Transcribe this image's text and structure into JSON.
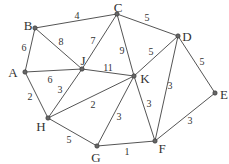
{
  "graph": {
    "nodes": [
      {
        "id": "A",
        "x": 25,
        "y": 72,
        "lx": 13,
        "ly": 72
      },
      {
        "id": "B",
        "x": 35,
        "y": 28,
        "lx": 28,
        "ly": 25
      },
      {
        "id": "C",
        "x": 117,
        "y": 14,
        "lx": 118,
        "ly": 7
      },
      {
        "id": "D",
        "x": 178,
        "y": 36,
        "lx": 187,
        "ly": 36
      },
      {
        "id": "E",
        "x": 215,
        "y": 93,
        "lx": 224,
        "ly": 94
      },
      {
        "id": "F",
        "x": 155,
        "y": 141,
        "lx": 162,
        "ly": 148
      },
      {
        "id": "G",
        "x": 97,
        "y": 146,
        "lx": 96,
        "ly": 157
      },
      {
        "id": "H",
        "x": 48,
        "y": 118,
        "lx": 41,
        "ly": 126
      },
      {
        "id": "J",
        "x": 82,
        "y": 69,
        "lx": 83,
        "ly": 60
      },
      {
        "id": "K",
        "x": 134,
        "y": 76,
        "lx": 145,
        "ly": 78
      }
    ],
    "edges": [
      {
        "from": "B",
        "to": "C",
        "weight": "4",
        "lx": 77,
        "ly": 16
      },
      {
        "from": "C",
        "to": "D",
        "weight": "5",
        "lx": 147,
        "ly": 18
      },
      {
        "from": "B",
        "to": "A",
        "weight": "6",
        "lx": 24,
        "ly": 48
      },
      {
        "from": "B",
        "to": "J",
        "weight": "8",
        "lx": 61,
        "ly": 42
      },
      {
        "from": "C",
        "to": "J",
        "weight": "7",
        "lx": 93,
        "ly": 41
      },
      {
        "from": "C",
        "to": "K",
        "weight": "9",
        "lx": 122,
        "ly": 51
      },
      {
        "from": "J",
        "to": "K",
        "weight": "11",
        "lx": 108,
        "ly": 68
      },
      {
        "from": "A",
        "to": "J",
        "weight": "6",
        "lx": 50,
        "ly": 80
      },
      {
        "from": "D",
        "to": "K",
        "weight": "5",
        "lx": 151,
        "ly": 52
      },
      {
        "from": "D",
        "to": "E",
        "weight": "5",
        "lx": 202,
        "ly": 62
      },
      {
        "from": "D",
        "to": "F",
        "weight": "3",
        "lx": 170,
        "ly": 86
      },
      {
        "from": "A",
        "to": "H",
        "weight": "2",
        "lx": 30,
        "ly": 97
      },
      {
        "from": "H",
        "to": "J",
        "weight": "3",
        "lx": 60,
        "ly": 90
      },
      {
        "from": "H",
        "to": "K",
        "weight": "2",
        "lx": 93,
        "ly": 105
      },
      {
        "from": "H",
        "to": "G",
        "weight": "5",
        "lx": 69,
        "ly": 140
      },
      {
        "from": "G",
        "to": "K",
        "weight": "3",
        "lx": 119,
        "ly": 117
      },
      {
        "from": "K",
        "to": "F",
        "weight": "3",
        "lx": 149,
        "ly": 104
      },
      {
        "from": "G",
        "to": "F",
        "weight": "1",
        "lx": 127,
        "ly": 152
      },
      {
        "from": "F",
        "to": "E",
        "weight": "3",
        "lx": 190,
        "ly": 121
      }
    ]
  },
  "colors": {
    "edge": "#555555",
    "node_fill": "#666666",
    "text": "#333333"
  }
}
